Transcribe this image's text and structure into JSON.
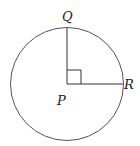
{
  "diagram": {
    "type": "circle-with-perpendicular-radii",
    "labels": {
      "center": "P",
      "top_point": "Q",
      "right_point": "R"
    },
    "right_angle_marker": true,
    "colors": {
      "stroke": "#444444",
      "text": "#222222",
      "background": "#ffffff"
    }
  }
}
